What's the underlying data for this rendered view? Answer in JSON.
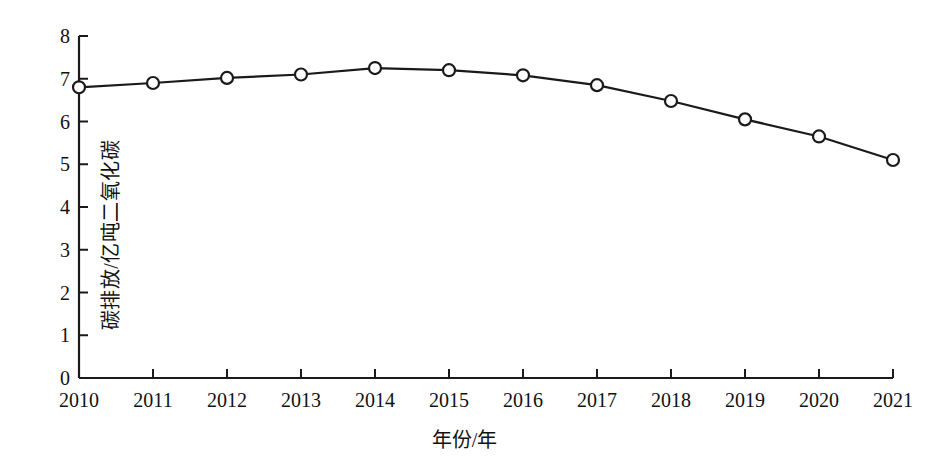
{
  "chart_data": {
    "type": "line",
    "title": "",
    "xlabel": "年份/年",
    "ylabel": "碳排放/亿吨二氧化碳",
    "categories": [
      "2010",
      "2011",
      "2012",
      "2013",
      "2014",
      "2015",
      "2016",
      "2017",
      "2018",
      "2019",
      "2020",
      "2021"
    ],
    "values": [
      6.8,
      6.9,
      7.02,
      7.1,
      7.25,
      7.2,
      7.08,
      6.85,
      6.48,
      6.05,
      5.65,
      5.1
    ],
    "series": [
      {
        "name": "碳排放",
        "values": [
          6.8,
          6.9,
          7.02,
          7.1,
          7.25,
          7.2,
          7.08,
          6.85,
          6.48,
          6.05,
          5.65,
          5.1
        ]
      }
    ],
    "ylim": [
      0,
      8
    ],
    "yticks": [
      0,
      1,
      2,
      3,
      4,
      5,
      6,
      7,
      8
    ],
    "ytick_labels": [
      "0",
      "1",
      "2",
      "3",
      "4",
      "5",
      "6",
      "7",
      "8"
    ],
    "xtick_labels": [
      "2010",
      "2011",
      "2012",
      "2013",
      "2014",
      "2015",
      "2016",
      "2017",
      "2018",
      "2019",
      "2020",
      "2021"
    ],
    "grid": false,
    "legend": false,
    "legend_position": "none",
    "marker": "open-circle",
    "line_color": "#1a1a1a",
    "marker_fill": "#ffffff",
    "marker_stroke": "#1a1a1a",
    "axis_color": "#1a1a1a"
  },
  "figure": {
    "caption": ""
  }
}
